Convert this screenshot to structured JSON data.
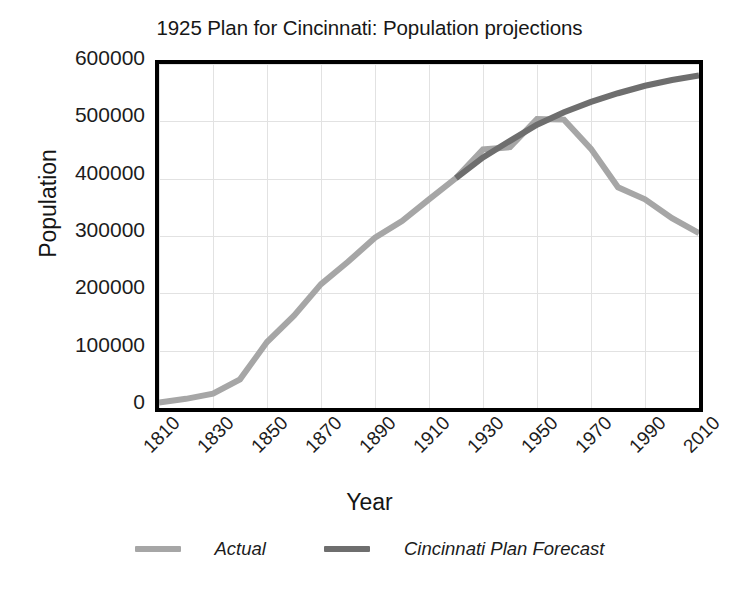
{
  "chart_data": {
    "type": "line",
    "title": "1925 Plan for Cincinnati: Population projections",
    "xlabel": "Year",
    "ylabel": "Population",
    "xlim": [
      1810,
      2010
    ],
    "ylim": [
      0,
      600000
    ],
    "xticks": [
      "1810",
      "1830",
      "1850",
      "1870",
      "1890",
      "1910",
      "1930",
      "1950",
      "1970",
      "1990",
      "2010"
    ],
    "yticks": [
      "0",
      "100000",
      "200000",
      "300000",
      "400000",
      "500000",
      "600000"
    ],
    "grid": true,
    "legend_position": "bottom",
    "series": [
      {
        "name": "Actual",
        "color": "#a6a6a6",
        "x": [
          1810,
          1820,
          1830,
          1840,
          1850,
          1860,
          1870,
          1880,
          1890,
          1900,
          1910,
          1920,
          1930,
          1940,
          1950,
          1960,
          1970,
          1980,
          1990,
          2000,
          2010
        ],
        "values": [
          9642,
          16000,
          25000,
          50000,
          115000,
          161000,
          216000,
          255000,
          297000,
          326000,
          364000,
          401000,
          451000,
          455000,
          504000,
          503000,
          452000,
          385000,
          364000,
          331000,
          305000
        ]
      },
      {
        "name": "Cincinnati Plan Forecast",
        "color": "#6e6e6e",
        "x": [
          1920,
          1930,
          1940,
          1950,
          1960,
          1970,
          1980,
          1990,
          2000,
          2010
        ],
        "values": [
          401000,
          437000,
          466000,
          494000,
          516000,
          534000,
          549000,
          562000,
          572000,
          580000
        ]
      }
    ]
  },
  "legend": {
    "items": [
      {
        "label": "Actual",
        "color": "#a6a6a6"
      },
      {
        "label": "Cincinnati Plan Forecast",
        "color": "#6e6e6e"
      }
    ]
  },
  "colors": {
    "actual": "#a6a6a6",
    "forecast": "#6e6e6e",
    "axis": "#000000",
    "grid": "#e2e2e2",
    "text": "#1c1c1c",
    "background": "#ffffff"
  }
}
